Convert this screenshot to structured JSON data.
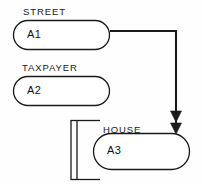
{
  "diagram": {
    "canvas": {
      "width": 203,
      "height": 186
    },
    "stroke_color": "#1a1a1a",
    "background_color": "#fefefe",
    "nodes": [
      {
        "id": "A1",
        "entity_label": "STREET",
        "shape": "stadium",
        "x": 13,
        "y": 20,
        "width": 97,
        "height": 30
      },
      {
        "id": "A2",
        "entity_label": "TAXPAYER",
        "shape": "stadium",
        "x": 13,
        "y": 76,
        "width": 97,
        "height": 30
      },
      {
        "id": "A3",
        "entity_label": "HOUSE",
        "shape": "stadium",
        "x": 93,
        "y": 133,
        "width": 97,
        "height": 37
      }
    ],
    "connectors": [
      {
        "from": "A1",
        "to": "A3",
        "style": "orthogonal",
        "arrowheads": 2,
        "arrow_direction": "down"
      }
    ],
    "bracket": {
      "shape": "square-bracket-left",
      "double_rule": true,
      "x": 70,
      "y": 120,
      "width": 30,
      "height": 60
    }
  }
}
